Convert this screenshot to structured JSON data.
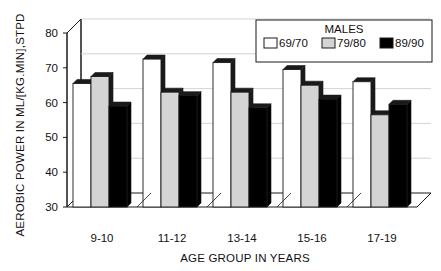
{
  "chart_data": {
    "type": "bar",
    "title": "",
    "xlabel": "AGE GROUP IN YEARS",
    "ylabel": "AEROBIC POWER IN ML/[KG.MIN],STPD",
    "categories": [
      "9-10",
      "11-12",
      "13-14",
      "15-16",
      "17-19"
    ],
    "series": [
      {
        "name": "69/70",
        "color": "#ffffff",
        "values": [
          65.5,
          72.5,
          71.5,
          69.5,
          66.0
        ]
      },
      {
        "name": "79/80",
        "color": "#d4d4d4",
        "values": [
          67.5,
          63.0,
          63.0,
          65.0,
          56.5
        ]
      },
      {
        "name": "89/90",
        "color": "#000000",
        "values": [
          59.0,
          62.0,
          58.5,
          61.0,
          59.5
        ]
      }
    ],
    "ylim": [
      30,
      80
    ],
    "yticks": [
      30,
      40,
      50,
      60,
      70,
      80
    ],
    "ytick_labels": [
      "30",
      "40",
      "50",
      "60",
      "70",
      "80"
    ],
    "grid": true,
    "legend_position": "top-right",
    "legend_title": "MALES",
    "style": "3d-bar",
    "axis_line_color": "#1a1a1a",
    "grid_color": "#c8c8c8",
    "background": "#ffffff"
  },
  "legend": {
    "title": "MALES",
    "entries": [
      {
        "label": "69/70",
        "swatch": "#ffffff"
      },
      {
        "label": "79/80",
        "swatch": "#d4d4d4"
      },
      {
        "label": "89/90",
        "swatch": "#000000"
      }
    ]
  },
  "axes": {
    "y_title": "AEROBIC POWER IN ML/[KG.MIN],STPD",
    "x_title": "AGE GROUP IN YEARS",
    "y_ticks": [
      "80",
      "70",
      "60",
      "50",
      "40",
      "30"
    ],
    "x_ticks": [
      "9-10",
      "11-12",
      "13-14",
      "15-16",
      "17-19"
    ]
  }
}
